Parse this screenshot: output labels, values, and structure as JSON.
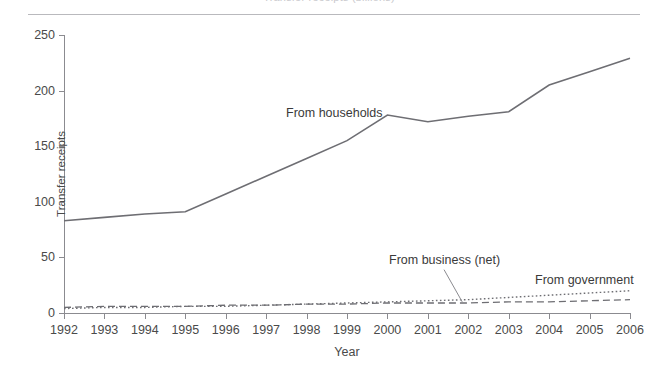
{
  "figure": {
    "title_clipped": "Transfer receipts (billions)",
    "colors": {
      "line": "#6e6e73",
      "axis": "#8b8b90",
      "text": "#3a3a3a",
      "rule": "#b9b9bd",
      "background": "#ffffff"
    }
  },
  "chart_data": {
    "type": "line",
    "title": "Transfer receipts (billions)",
    "xlabel": "Year",
    "ylabel": "Transfer receipts",
    "xlim": [
      1992,
      2006
    ],
    "ylim": [
      0,
      250
    ],
    "yticks": [
      0,
      50,
      100,
      150,
      200,
      250
    ],
    "ytick_labels": [
      "0",
      "50",
      "100",
      "150",
      "200",
      "250"
    ],
    "grid": false,
    "legend_position": "inline-annotations",
    "x": [
      1992,
      1993,
      1994,
      1995,
      1996,
      1997,
      1998,
      1999,
      2000,
      2001,
      2002,
      2003,
      2004,
      2005,
      2006
    ],
    "xtick_labels": [
      "1992",
      "1993",
      "1994",
      "1995",
      "1996",
      "1997",
      "1998",
      "1999",
      "2000",
      "2001",
      "2002",
      "2003",
      "2004",
      "2005",
      "2006"
    ],
    "series": [
      {
        "name": "From households",
        "style": "solid",
        "label": "From households",
        "values": [
          83,
          86,
          89,
          91,
          107,
          123,
          139,
          155,
          178,
          172,
          177,
          181,
          205,
          217,
          229
        ]
      },
      {
        "name": "From business (net)",
        "style": "dashed",
        "label": "From business (net)",
        "values": [
          5,
          6,
          6,
          6,
          7,
          7,
          8,
          8,
          9,
          9,
          9,
          10,
          10,
          11,
          12
        ]
      },
      {
        "name": "From government",
        "style": "dotted",
        "label": "From government",
        "values": [
          4,
          5,
          5,
          6,
          6,
          7,
          8,
          9,
          10,
          11,
          12,
          14,
          16,
          18,
          20
        ]
      }
    ],
    "annotations": [
      {
        "text": "From households",
        "x": 1999,
        "y": 196
      },
      {
        "text": "From business (net)",
        "x": 2001.4,
        "y": 47,
        "leader": true
      },
      {
        "text": "From government",
        "x": 2004.5,
        "y": 30
      }
    ]
  }
}
